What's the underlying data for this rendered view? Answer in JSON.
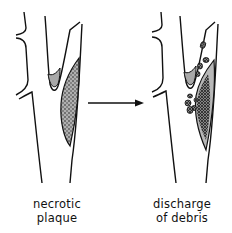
{
  "figure": {
    "panels": [
      {
        "id": "left",
        "caption_lines": [
          "necrotic",
          "plaque"
        ]
      },
      {
        "id": "right",
        "caption_lines": [
          "discharge",
          "of debris"
        ]
      }
    ],
    "arrow": {
      "direction": "right"
    },
    "colors": {
      "line": "#111111",
      "plaque_fill": "#a8a8a8",
      "background": "#ffffff"
    }
  }
}
